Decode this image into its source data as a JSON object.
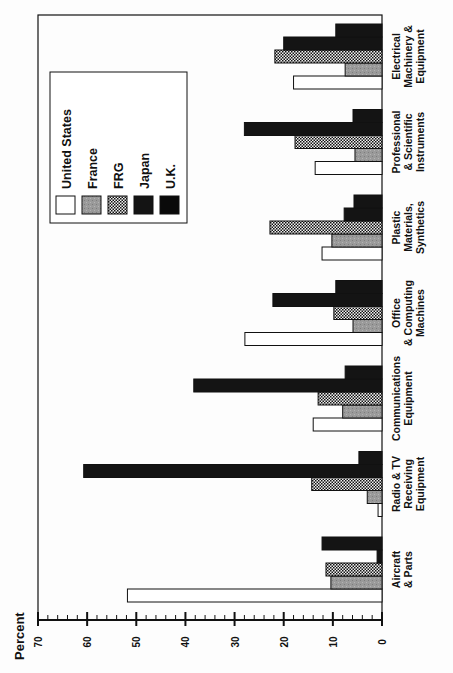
{
  "chart_data": {
    "type": "bar",
    "orientation": "rotated-90-clockwise (horizontal bars in image, vertical in source figure)",
    "title": "",
    "xlabel": "",
    "ylabel": "Percent",
    "ylim": [
      0,
      70
    ],
    "y_ticks": [
      "0",
      "10",
      "20",
      "30",
      "40",
      "50",
      "60",
      "70"
    ],
    "minor_tick_step": 2,
    "grid": false,
    "legend_position": "upper-left (inside plot)",
    "categories": [
      "Aircraft & Parts",
      "Radio & TV Receiving Equipment",
      "Communications Equipment",
      "Office & Computing Machines",
      "Plastic Materials, Synthetics",
      "Professional & Scientific Instruments",
      "Electrical Machinery & Equipment"
    ],
    "category_label_lines": [
      [
        "Aircraft",
        "& Parts"
      ],
      [
        "Radio & TV",
        "Receiving",
        "Equipment"
      ],
      [
        "Communications",
        "Equipment"
      ],
      [
        "Office",
        "& Computing",
        "Machines"
      ],
      [
        "Plastic",
        "Materials,",
        "Synthetics"
      ],
      [
        "Professional",
        "& Scientific",
        "Instruments"
      ],
      [
        "Electrical",
        "Machinery &",
        "Equipment"
      ]
    ],
    "series": [
      {
        "name": "United States",
        "pattern": "white",
        "values": [
          51.8,
          0.8,
          14.0,
          27.9,
          12.2,
          13.6,
          18.0
        ]
      },
      {
        "name": "France",
        "pattern": "gray",
        "values": [
          10.4,
          3.0,
          8.0,
          5.9,
          10.2,
          5.5,
          7.5
        ]
      },
      {
        "name": "FRG",
        "pattern": "checker",
        "values": [
          11.4,
          14.3,
          13.0,
          9.8,
          22.8,
          17.7,
          21.8
        ]
      },
      {
        "name": "Japan",
        "pattern": "black",
        "values": [
          1.0,
          60.7,
          38.3,
          22.2,
          7.7,
          28.0,
          20.0
        ]
      },
      {
        "name": "U.K.",
        "pattern": "black",
        "values": [
          12.2,
          4.7,
          7.5,
          9.4,
          5.7,
          5.9,
          9.4
        ]
      }
    ]
  },
  "legend": {
    "items": [
      "United States",
      "France",
      "FRG",
      "Japan",
      "U.K."
    ]
  },
  "axis": {
    "label": "Percent"
  },
  "colors": {
    "background": "#fdfdfd",
    "ink": "#111111",
    "us_fill": "#ffffff",
    "france_fill": "#9a9a9a",
    "japan_fill": "#141414",
    "uk_fill": "#0a0a0a"
  }
}
